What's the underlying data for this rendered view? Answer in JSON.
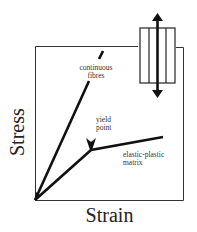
{
  "diagram": {
    "type": "stress-strain diagram of fibre composite",
    "axes": {
      "x_label": "Strain",
      "y_label": "Stress"
    },
    "curves": [
      {
        "name": "continuous fibres",
        "label_lines": [
          "continuous",
          "fibres"
        ],
        "shape": "straight steep line from origin"
      },
      {
        "name": "elastic-plastic matrix",
        "label_lines": [
          "elastic-plastic",
          "matrix"
        ],
        "shape": "linear then shallower after yield point"
      }
    ],
    "annotation": {
      "label_lines": [
        "yield",
        "point"
      ],
      "points_to": "knee of matrix curve"
    },
    "inset": {
      "depicts": "fibre bundle in rectangle with vertical double-headed load arrow",
      "fibre_count": 4
    },
    "colors": {
      "line": "#111111",
      "background": "#ffffff",
      "frame": "#333333"
    }
  }
}
